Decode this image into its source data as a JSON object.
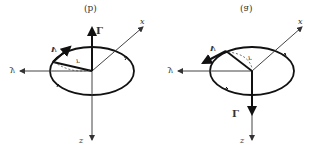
{
  "figure": {
    "orientation": "vertically-flipped",
    "panels": [
      {
        "id": "b",
        "caption": "(b)",
        "vector_L_direction": "up",
        "labels": {
          "L": "L",
          "v": "v",
          "r": "r",
          "y": "y",
          "x": "x",
          "z": "z"
        }
      },
      {
        "id": "a",
        "caption": "(a)",
        "vector_L_direction": "down",
        "labels": {
          "L": "L",
          "v": "v",
          "r": "r",
          "y": "y",
          "x": "x",
          "z": "z"
        }
      }
    ]
  },
  "colors": {
    "line": "#111111",
    "axis": "#444444",
    "background": "#ffffff"
  }
}
